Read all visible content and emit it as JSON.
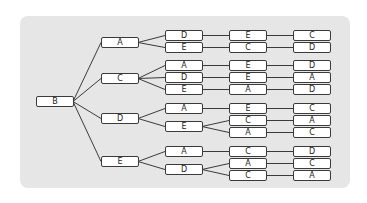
{
  "diagram": {
    "type": "tree",
    "orientation": "left-to-right",
    "root": "B",
    "colors": {
      "panel": "#e6e6e6",
      "node_fill": "#ffffff",
      "stroke": "#3a3a3a"
    },
    "nodes": {
      "root": {
        "label": "B",
        "x": 36,
        "y": 96
      },
      "l1_0": {
        "label": "A",
        "x": 101,
        "y": 37
      },
      "l1_1": {
        "label": "C",
        "x": 101,
        "y": 73
      },
      "l1_2": {
        "label": "D",
        "x": 101,
        "y": 113
      },
      "l1_3": {
        "label": "E",
        "x": 101,
        "y": 156
      },
      "l2_0": {
        "label": "D",
        "x": 165,
        "y": 30
      },
      "l2_1": {
        "label": "E",
        "x": 165,
        "y": 42
      },
      "l2_2": {
        "label": "A",
        "x": 165,
        "y": 60
      },
      "l2_3": {
        "label": "D",
        "x": 165,
        "y": 72
      },
      "l2_4": {
        "label": "E",
        "x": 165,
        "y": 84
      },
      "l2_5": {
        "label": "A",
        "x": 165,
        "y": 103
      },
      "l2_6": {
        "label": "E",
        "x": 165,
        "y": 121
      },
      "l2_7": {
        "label": "A",
        "x": 165,
        "y": 146
      },
      "l2_8": {
        "label": "D",
        "x": 165,
        "y": 164
      },
      "l3_0": {
        "label": "E",
        "x": 229,
        "y": 30
      },
      "l3_1": {
        "label": "C",
        "x": 229,
        "y": 42
      },
      "l3_2": {
        "label": "E",
        "x": 229,
        "y": 60
      },
      "l3_3": {
        "label": "E",
        "x": 229,
        "y": 72
      },
      "l3_4": {
        "label": "A",
        "x": 229,
        "y": 84
      },
      "l3_5": {
        "label": "E",
        "x": 229,
        "y": 103
      },
      "l3_6": {
        "label": "C",
        "x": 229,
        "y": 115
      },
      "l3_7": {
        "label": "A",
        "x": 229,
        "y": 127
      },
      "l3_8": {
        "label": "C",
        "x": 229,
        "y": 146
      },
      "l3_9": {
        "label": "A",
        "x": 229,
        "y": 158
      },
      "l3_10": {
        "label": "C",
        "x": 229,
        "y": 170
      },
      "l4_0": {
        "label": "C",
        "x": 293,
        "y": 30
      },
      "l4_1": {
        "label": "D",
        "x": 293,
        "y": 42
      },
      "l4_2": {
        "label": "D",
        "x": 293,
        "y": 60
      },
      "l4_3": {
        "label": "A",
        "x": 293,
        "y": 72
      },
      "l4_4": {
        "label": "D",
        "x": 293,
        "y": 84
      },
      "l4_5": {
        "label": "C",
        "x": 293,
        "y": 103
      },
      "l4_6": {
        "label": "A",
        "x": 293,
        "y": 115
      },
      "l4_7": {
        "label": "C",
        "x": 293,
        "y": 127
      },
      "l4_8": {
        "label": "D",
        "x": 293,
        "y": 146
      },
      "l4_9": {
        "label": "C",
        "x": 293,
        "y": 158
      },
      "l4_10": {
        "label": "A",
        "x": 293,
        "y": 170
      }
    },
    "edges": [
      [
        "root",
        "l1_0"
      ],
      [
        "root",
        "l1_1"
      ],
      [
        "root",
        "l1_2"
      ],
      [
        "root",
        "l1_3"
      ],
      [
        "l1_0",
        "l2_0"
      ],
      [
        "l1_0",
        "l2_1"
      ],
      [
        "l1_1",
        "l2_2"
      ],
      [
        "l1_1",
        "l2_3"
      ],
      [
        "l1_1",
        "l2_4"
      ],
      [
        "l1_2",
        "l2_5"
      ],
      [
        "l1_2",
        "l2_6"
      ],
      [
        "l1_3",
        "l2_7"
      ],
      [
        "l1_3",
        "l2_8"
      ],
      [
        "l2_0",
        "l3_0"
      ],
      [
        "l2_1",
        "l3_1"
      ],
      [
        "l2_2",
        "l3_2"
      ],
      [
        "l2_3",
        "l3_3"
      ],
      [
        "l2_4",
        "l3_4"
      ],
      [
        "l2_5",
        "l3_5"
      ],
      [
        "l2_6",
        "l3_6"
      ],
      [
        "l2_6",
        "l3_7"
      ],
      [
        "l2_7",
        "l3_8"
      ],
      [
        "l2_8",
        "l3_9"
      ],
      [
        "l2_8",
        "l3_10"
      ],
      [
        "l3_0",
        "l4_0"
      ],
      [
        "l3_1",
        "l4_1"
      ],
      [
        "l3_2",
        "l4_2"
      ],
      [
        "l3_3",
        "l4_3"
      ],
      [
        "l3_4",
        "l4_4"
      ],
      [
        "l3_5",
        "l4_5"
      ],
      [
        "l3_6",
        "l4_6"
      ],
      [
        "l3_7",
        "l4_7"
      ],
      [
        "l3_8",
        "l4_8"
      ],
      [
        "l3_9",
        "l4_9"
      ],
      [
        "l3_10",
        "l4_10"
      ]
    ],
    "paths": [
      [
        "B",
        "A",
        "D",
        "E",
        "C"
      ],
      [
        "B",
        "A",
        "E",
        "C",
        "D"
      ],
      [
        "B",
        "C",
        "A",
        "E",
        "D"
      ],
      [
        "B",
        "C",
        "D",
        "E",
        "A"
      ],
      [
        "B",
        "C",
        "E",
        "A",
        "D"
      ],
      [
        "B",
        "D",
        "A",
        "E",
        "C"
      ],
      [
        "B",
        "D",
        "E",
        "C",
        "A"
      ],
      [
        "B",
        "D",
        "E",
        "A",
        "C"
      ],
      [
        "B",
        "E",
        "A",
        "C",
        "D"
      ],
      [
        "B",
        "E",
        "D",
        "A",
        "C"
      ],
      [
        "B",
        "E",
        "D",
        "C",
        "A"
      ]
    ]
  }
}
